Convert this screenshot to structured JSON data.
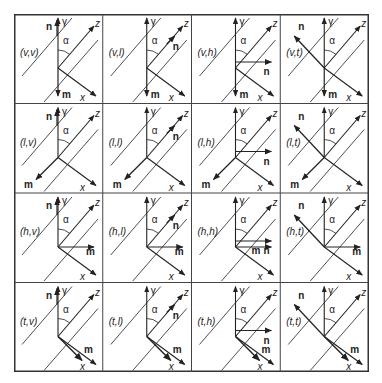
{
  "figure": {
    "rows": [
      "v",
      "l",
      "h",
      "t"
    ],
    "columns": [
      "v",
      "l",
      "h",
      "t"
    ],
    "axis_labels": {
      "gamma": "γ",
      "z": "z",
      "x": "x",
      "alpha": "α"
    },
    "vector_labels": {
      "n": "n",
      "m": "m"
    },
    "cells": [
      {
        "label": "(v,v)",
        "m": "down",
        "n": "up"
      },
      {
        "label": "(v,l)",
        "m": "down",
        "n": "along-z"
      },
      {
        "label": "(v,h)",
        "m": "down",
        "n": "right"
      },
      {
        "label": "(v,t)",
        "m": "down",
        "n": "up-left"
      },
      {
        "label": "(l,v)",
        "m": "down-left",
        "n": "up"
      },
      {
        "label": "(l,l)",
        "m": "down-left",
        "n": "along-z"
      },
      {
        "label": "(l,h)",
        "m": "down-left",
        "n": "right"
      },
      {
        "label": "(l,t)",
        "m": "down-left",
        "n": "up-left"
      },
      {
        "label": "(h,v)",
        "m": "right",
        "n": "up"
      },
      {
        "label": "(h,l)",
        "m": "right",
        "n": "along-z"
      },
      {
        "label": "(h,h)",
        "m": "right",
        "n": "right"
      },
      {
        "label": "(h,t)",
        "m": "right",
        "n": "up-left"
      },
      {
        "label": "(t,v)",
        "m": "along-x",
        "n": "up"
      },
      {
        "label": "(t,l)",
        "m": "along-x",
        "n": "along-z"
      },
      {
        "label": "(t,h)",
        "m": "along-x",
        "n": "right"
      },
      {
        "label": "(t,t)",
        "m": "along-x",
        "n": "up-left"
      }
    ]
  }
}
